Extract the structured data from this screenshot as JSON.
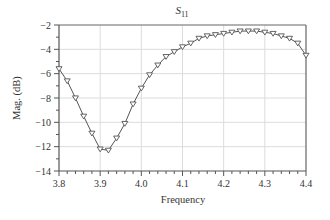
{
  "chart_data": {
    "type": "line",
    "title": "S11",
    "title_main": "S",
    "title_sub": "11",
    "xlabel": "Frequency",
    "ylabel": "Mag. (dB)",
    "xlim": [
      3.8,
      4.4
    ],
    "ylim": [
      -14,
      -2
    ],
    "xticks": [
      3.8,
      3.9,
      4.0,
      4.1,
      4.2,
      4.3,
      4.4
    ],
    "xtick_labels": [
      "3.8",
      "3.9",
      "4.0",
      "4.1",
      "4.2",
      "4.3",
      "4.4"
    ],
    "yticks": [
      -2,
      -4,
      -6,
      -8,
      -10,
      -12,
      -14
    ],
    "ytick_labels": [
      "−2",
      "−4",
      "−6",
      "−8",
      "−10",
      "−12",
      "−14"
    ],
    "grid": true,
    "legend": null,
    "marker": "triangle-down",
    "series": [
      {
        "name": "S11",
        "color": "#555555",
        "x": [
          3.8,
          3.82,
          3.84,
          3.86,
          3.88,
          3.9,
          3.92,
          3.94,
          3.96,
          3.98,
          4.0,
          4.02,
          4.04,
          4.06,
          4.08,
          4.1,
          4.12,
          4.14,
          4.16,
          4.18,
          4.2,
          4.22,
          4.24,
          4.26,
          4.28,
          4.3,
          4.32,
          4.34,
          4.36,
          4.38,
          4.4
        ],
        "y": [
          -5.6,
          -6.6,
          -8.0,
          -9.5,
          -10.9,
          -12.2,
          -12.3,
          -11.3,
          -10.1,
          -8.5,
          -7.2,
          -6.1,
          -5.3,
          -4.6,
          -4.2,
          -3.8,
          -3.5,
          -3.1,
          -2.9,
          -2.8,
          -2.7,
          -2.6,
          -2.5,
          -2.5,
          -2.5,
          -2.6,
          -2.7,
          -2.9,
          -3.1,
          -3.5,
          -4.5
        ]
      }
    ]
  }
}
